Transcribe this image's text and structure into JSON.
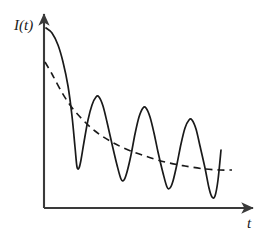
{
  "figure": {
    "title": "",
    "background_color": "#ffffff",
    "stroke_color": "#1a1a1a",
    "axis_color": "#3a3a3a"
  },
  "axes": {
    "y_label": "I(t)",
    "x_label": "t",
    "y_axis_name": "intensity-axis",
    "x_axis_name": "time-axis",
    "origin_px": [
      44,
      208
    ],
    "y_tip_px": [
      44,
      12
    ],
    "x_tip_px": [
      256,
      208
    ],
    "ticks": [],
    "tick_labels": []
  },
  "chart_data": {
    "type": "line",
    "title": "",
    "xlabel": "t",
    "ylabel": "I(t)",
    "grid": false,
    "legend": false,
    "xlim": [
      0,
      190
    ],
    "ylim": [
      0,
      185
    ],
    "axis_arrows": true,
    "series": [
      {
        "name": "damped-oscillation",
        "style": "solid",
        "color": "#1a1a1a",
        "width": 1.7,
        "points_px": [
          [
            46,
            28
          ],
          [
            52,
            33
          ],
          [
            58,
            45
          ],
          [
            63,
            62
          ],
          [
            68,
            86
          ],
          [
            72,
            116
          ],
          [
            75,
            147
          ],
          [
            77,
            167
          ],
          [
            79,
            168
          ],
          [
            81,
            160
          ],
          [
            84,
            142
          ],
          [
            88,
            120
          ],
          [
            92,
            105
          ],
          [
            96,
            97
          ],
          [
            99,
            97
          ],
          [
            103,
            106
          ],
          [
            107,
            122
          ],
          [
            112,
            144
          ],
          [
            117,
            165
          ],
          [
            121,
            179
          ],
          [
            124,
            180
          ],
          [
            127,
            172
          ],
          [
            131,
            155
          ],
          [
            135,
            134
          ],
          [
            139,
            117
          ],
          [
            143,
            108
          ],
          [
            146,
            108
          ],
          [
            150,
            117
          ],
          [
            154,
            133
          ],
          [
            158,
            152
          ],
          [
            163,
            173
          ],
          [
            167,
            187
          ],
          [
            170,
            188
          ],
          [
            173,
            181
          ],
          [
            177,
            164
          ],
          [
            181,
            144
          ],
          [
            185,
            128
          ],
          [
            189,
            120
          ],
          [
            192,
            120
          ],
          [
            196,
            129
          ],
          [
            200,
            146
          ],
          [
            205,
            168
          ],
          [
            209,
            188
          ],
          [
            212,
            197
          ],
          [
            215,
            196
          ],
          [
            218,
            180
          ],
          [
            221,
            150
          ]
        ]
      },
      {
        "name": "exponential-decay-envelope",
        "style": "dashed",
        "color": "#1a1a1a",
        "width": 1.6,
        "dash_pattern": "7,5",
        "points_px": [
          [
            45,
            62
          ],
          [
            52,
            74
          ],
          [
            60,
            89
          ],
          [
            70,
            105
          ],
          [
            82,
            119
          ],
          [
            95,
            131
          ],
          [
            110,
            141
          ],
          [
            126,
            149
          ],
          [
            145,
            156
          ],
          [
            165,
            162
          ],
          [
            185,
            166
          ],
          [
            205,
            169
          ],
          [
            220,
            170
          ],
          [
            232,
            170
          ]
        ]
      }
    ],
    "annotations": [
      {
        "text": "I(t)",
        "role": "y-axis-label"
      },
      {
        "text": "t",
        "role": "x-axis-label"
      }
    ]
  }
}
